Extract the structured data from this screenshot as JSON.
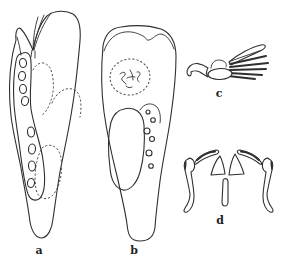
{
  "panel_labels": {
    "a": "a",
    "b": "b",
    "c": "c",
    "d": "d"
  },
  "colors": {
    "background": "#ffffff",
    "ink": "#2f2f2f",
    "dotted": "#4a4a4a"
  }
}
